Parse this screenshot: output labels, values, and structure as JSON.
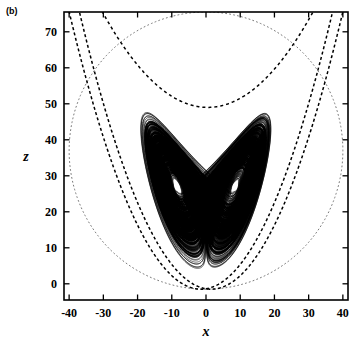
{
  "figure": {
    "panel_label": "(b)",
    "caption_type": "phase-portrait"
  },
  "chart_data": {
    "type": "line",
    "title": "",
    "subtitle": "",
    "xlabel": "x",
    "ylabel": "z",
    "xlim": [
      -41.5,
      41.5
    ],
    "ylim": [
      -4.5,
      75.5
    ],
    "xticks": [
      -40,
      -30,
      -20,
      -10,
      0,
      10,
      20,
      30,
      40
    ],
    "xticklabels": [
      "-40",
      "-30",
      "-20",
      "-10",
      "0",
      "10",
      "20",
      "30",
      "40"
    ],
    "yticks": [
      0,
      10,
      20,
      30,
      40,
      50,
      60,
      70
    ],
    "yticklabels": [
      "0",
      "10",
      "20",
      "30",
      "40",
      "50",
      "60",
      "70"
    ],
    "grid": false,
    "legend": null,
    "ticks_all_sides": true,
    "tick_direction": "in",
    "frame": true,
    "series": [
      {
        "name": "lorenz-attractor",
        "style": "solid",
        "color": "#000000",
        "description": "Lorenz strange attractor projected on the x-z plane, two lobes (butterfly)",
        "params": {
          "sigma": 10,
          "rho": 28,
          "beta": 2.6667
        },
        "fixed_points": [
          {
            "x": -8.49,
            "z": 27.0
          },
          {
            "x": 8.49,
            "z": 27.0
          }
        ],
        "outer_extent": {
          "x_min": -19.5,
          "x_max": 19.5,
          "z_min": -1.0,
          "z_max": 48.0
        }
      },
      {
        "name": "trapping-ellipse",
        "style": "dotted",
        "color": "#7a7a7a",
        "description": "dotted elliptical trapping-region boundary",
        "center": {
          "x": 0,
          "z": 37.0
        },
        "radii": {
          "x": 40.0,
          "z": 38.5
        }
      },
      {
        "name": "narrow-parabola-left",
        "style": "dashed",
        "color": "#000000",
        "description": "steep dashed parabola branch on the left",
        "vertex": {
          "x": -1.5,
          "z": -1.5
        },
        "curvature": 0.052
      },
      {
        "name": "narrow-parabola-right",
        "style": "dashed",
        "color": "#000000",
        "description": "steep dashed parabola branch on the right",
        "vertex": {
          "x": 1.5,
          "z": -1.5
        },
        "curvature": 0.052
      },
      {
        "name": "wide-parabola",
        "style": "dashed",
        "color": "#000000",
        "description": "wide dashed parabola with minimum near z = 49",
        "vertex": {
          "x": 0.5,
          "z": 49.0
        },
        "curvature": 0.028
      }
    ]
  }
}
